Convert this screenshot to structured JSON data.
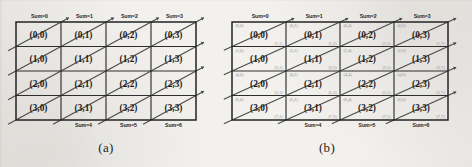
{
  "figure": {
    "caption_a": "(a)",
    "caption_b": "(b)",
    "rows": 4,
    "cols": 4,
    "ink_color": "#2e2e2e",
    "diagonal_color": "#4a4a4a",
    "sublabel_color": "#8b8b8b",
    "paper_color": "#f2f1ee"
  },
  "panel_a": {
    "name": "(a)",
    "cell_labels": [
      [
        "(0,0)",
        "(0,1)",
        "(0,2)",
        "(0,3)"
      ],
      [
        "(1,0)",
        "(1,1)",
        "(1,2)",
        "(1,3)"
      ],
      [
        "(2,0)",
        "(2,1)",
        "(2,2)",
        "(2,3)"
      ],
      [
        "(3,0)",
        "(3,1)",
        "(3,2)",
        "(3,3)"
      ]
    ],
    "top_sum_labels": [
      "Sum=0",
      "Sum=1",
      "Sum=2",
      "Sum=3"
    ],
    "bottom_sum_labels": [
      "Sum=4",
      "Sum=5",
      "Sum=6"
    ]
  },
  "panel_b": {
    "name": "(b)",
    "cell_labels": [
      [
        "(0,0)",
        "(0,1)",
        "(0,2)",
        "(0,3)"
      ],
      [
        "(1,0)",
        "(1,1)",
        "(1,2)",
        "(1,3)"
      ],
      [
        "(2,0)",
        "(2,1)",
        "(2,2)",
        "(2,3)"
      ],
      [
        "(3,0)",
        "(3,1)",
        "(3,2)",
        "(3,3)"
      ]
    ],
    "corner_labels_tl": [
      [
        "(0,0)",
        "(0,2)",
        "(0,4)",
        "(0,6)"
      ],
      [
        "(2,0)",
        "(2,2)",
        "(2,4)",
        "(2,6)"
      ],
      [
        "(4,0)",
        "(4,2)",
        "(4,4)",
        "(4,6)"
      ],
      [
        "(6,0)",
        "(6,2)",
        "(6,4)",
        "(6,6)"
      ]
    ],
    "corner_labels_br": [
      [
        "(1,1)",
        "(1,3)",
        "(1,5)",
        "(1,7)"
      ],
      [
        "(3,1)",
        "(3,3)",
        "(3,5)",
        "(3,7)"
      ],
      [
        "(5,1)",
        "(5,3)",
        "(5,5)",
        "(5,7)"
      ],
      [
        "(7,1)",
        "(7,3)",
        "(7,5)",
        "(7,7)"
      ]
    ],
    "top_sum_labels": [
      "Sum=0",
      "Sum=1",
      "Sum=2",
      "Sum=3"
    ],
    "bottom_sum_labels": [
      "Sum=4",
      "Sum=5",
      "Sum=6"
    ]
  }
}
